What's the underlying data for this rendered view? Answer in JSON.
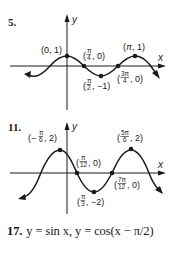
{
  "problems": [
    {
      "number": "5.",
      "axes": {
        "x_label": "x",
        "y_label": "y"
      },
      "points": [
        {
          "label": "(0, 1)",
          "x": "0",
          "y": "1"
        },
        {
          "label": "(π/4, 0)",
          "x": "π/4",
          "y": "0"
        },
        {
          "label": "(π/2, −1)",
          "x": "π/2",
          "y": "−1"
        },
        {
          "label": "(3π/4, 0)",
          "x": "3π/4",
          "y": "0"
        },
        {
          "label": "(π, 1)",
          "x": "π",
          "y": "1"
        }
      ]
    },
    {
      "number": "11.",
      "axes": {
        "x_label": "x",
        "y_label": "y"
      },
      "points": [
        {
          "label": "(−π/6, 2)",
          "x": "−π/6",
          "y": "2"
        },
        {
          "label": "(π/12, 0)",
          "x": "π/12",
          "y": "0"
        },
        {
          "label": "(π/3, −2)",
          "x": "π/3",
          "y": "−2"
        },
        {
          "label": "(7π/12, 0)",
          "x": "7π/12",
          "y": "0"
        },
        {
          "label": "(5π/6, 2)",
          "x": "5π/6",
          "y": "2"
        }
      ]
    }
  ],
  "answer17": {
    "number": "17.",
    "text": "y = sin x, y = cos(x − π/2)"
  }
}
